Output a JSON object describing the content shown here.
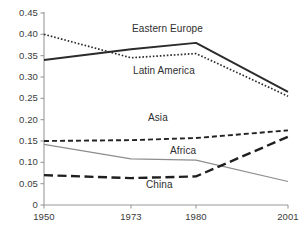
{
  "chart_data": {
    "type": "line",
    "title": "",
    "subtitle": "",
    "xlabel": "",
    "ylabel": "",
    "x": [
      "1950",
      "1973",
      "1980",
      "2001"
    ],
    "categories": [
      "1950",
      "1973",
      "1980",
      "2001"
    ],
    "xtick_labels": [
      "1950",
      "1973",
      "1980",
      "2001"
    ],
    "ytick_labels": [
      "0",
      "0.05",
      "0.10",
      "0.15",
      "0.20",
      "0.25",
      "0.30",
      "0.35",
      "0.40",
      "0.45"
    ],
    "ytick_values": [
      0,
      0.05,
      0.1,
      0.15,
      0.2,
      0.25,
      0.3,
      0.35,
      0.4,
      0.45
    ],
    "ylim": [
      0,
      0.45
    ],
    "grid": false,
    "legend_position": "inline-annotations",
    "series": [
      {
        "name": "Eastern Europe",
        "values": [
          0.34,
          0.365,
          0.38,
          0.265
        ],
        "style": "solid",
        "color": "#2b2b2b",
        "width": 1.9,
        "label_x": 132,
        "label_y": 23
      },
      {
        "name": "Latin America",
        "values": [
          0.4,
          0.345,
          0.355,
          0.255
        ],
        "style": "dotted",
        "color": "#2b2b2b",
        "width": 1.7,
        "label_x": 133,
        "label_y": 65
      },
      {
        "name": "Asia",
        "values": [
          0.15,
          0.152,
          0.157,
          0.175
        ],
        "style": "dashed",
        "color": "#232323",
        "width": 1.9,
        "label_x": 148,
        "label_y": 112
      },
      {
        "name": "Africa",
        "values": [
          0.142,
          0.108,
          0.105,
          0.055
        ],
        "style": "solid-thin",
        "color": "#8d8d8d",
        "width": 1.2,
        "label_x": 170,
        "label_y": 145
      },
      {
        "name": "China",
        "values": [
          0.07,
          0.063,
          0.067,
          0.16
        ],
        "style": "long-dash",
        "color": "#1f1f1f",
        "width": 2.4,
        "label_x": 146,
        "label_y": 179
      }
    ],
    "annotations": [
      {
        "text": "Eastern Europe",
        "series": "Eastern Europe"
      },
      {
        "text": "Latin America",
        "series": "Latin America"
      },
      {
        "text": "Asia",
        "series": "Asia"
      },
      {
        "text": "Africa",
        "series": "Africa"
      },
      {
        "text": "China",
        "series": "China"
      }
    ],
    "axis_color": "#9a9a9a",
    "text_color": "#3b3b3b"
  },
  "geometry": {
    "plot_left": 44,
    "plot_right": 288,
    "plot_top": 13,
    "plot_bottom": 205,
    "x_positions": [
      44,
      131,
      196,
      288
    ]
  }
}
